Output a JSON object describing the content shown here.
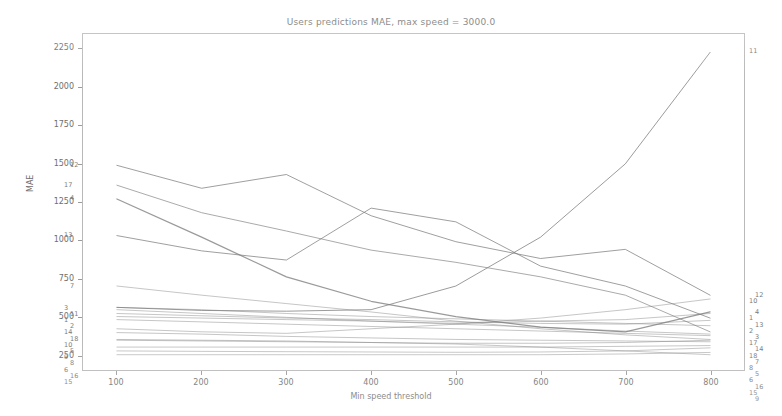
{
  "chart_data": {
    "type": "line",
    "title": "Users predictions MAE, max speed = 3000.0",
    "xlabel": "Min speed threshold",
    "ylabel": "MAE",
    "x": [
      100,
      200,
      300,
      400,
      500,
      600,
      700,
      800
    ],
    "xlim": [
      60,
      840
    ],
    "ylim": [
      150,
      2350
    ],
    "xticks": [
      100,
      200,
      300,
      400,
      500,
      600,
      700,
      800
    ],
    "yticks": [
      250,
      500,
      750,
      1000,
      1250,
      1500,
      1750,
      2000,
      2250
    ],
    "grid": false,
    "legend": "endpoint-annotations",
    "series": [
      {
        "name": "1",
        "label_left": "1",
        "label_right": "1",
        "values": [
          545,
          520,
          495,
          470,
          455,
          470,
          480,
          520
        ]
      },
      {
        "name": "2",
        "label_left": "2",
        "label_right": "2",
        "values": [
          520,
          505,
          490,
          480,
          465,
          455,
          450,
          475
        ]
      },
      {
        "name": "3",
        "label_left": "3",
        "label_right": "3",
        "values": [
          560,
          545,
          520,
          500,
          485,
          470,
          455,
          440
        ]
      },
      {
        "name": "4",
        "label_left": "4",
        "label_right": "4",
        "values": [
          1270,
          1020,
          760,
          600,
          500,
          430,
          400,
          530
        ]
      },
      {
        "name": "5",
        "label_left": "5",
        "label_right": "5",
        "values": [
          395,
          385,
          370,
          360,
          350,
          345,
          340,
          335
        ]
      },
      {
        "name": "6",
        "label_left": "6",
        "label_right": "6",
        "values": [
          300,
          300,
          300,
          300,
          300,
          300,
          305,
          310
        ]
      },
      {
        "name": "7",
        "label_left": "7",
        "label_right": "7",
        "values": [
          700,
          640,
          585,
          530,
          470,
          420,
          380,
          350
        ]
      },
      {
        "name": "8",
        "label_left": "8",
        "label_right": "8",
        "values": [
          345,
          340,
          335,
          330,
          325,
          325,
          330,
          345
        ]
      },
      {
        "name": "9",
        "label_left": "9",
        "label_right": "9",
        "values": [
          350,
          345,
          340,
          330,
          320,
          300,
          275,
          250
        ]
      },
      {
        "name": "10",
        "label_left": "10",
        "label_right": "10",
        "values": [
          420,
          400,
          390,
          420,
          450,
          490,
          545,
          615
        ]
      },
      {
        "name": "11",
        "label_left": "11",
        "label_right": "11",
        "values": [
          560,
          540,
          535,
          545,
          700,
          1020,
          1500,
          2230
        ]
      },
      {
        "name": "12",
        "label_left": "12",
        "label_right": "12",
        "values": [
          1490,
          1340,
          1430,
          1160,
          990,
          880,
          940,
          640
        ]
      },
      {
        "name": "13",
        "label_left": "13",
        "label_right": "13",
        "values": [
          1030,
          930,
          870,
          1210,
          1120,
          830,
          700,
          490
        ]
      },
      {
        "name": "14",
        "label_left": "14",
        "label_right": "14",
        "values": [
          500,
          490,
          480,
          470,
          450,
          430,
          405,
          385
        ]
      },
      {
        "name": "15",
        "label_left": "15",
        "label_right": "15",
        "values": [
          250,
          250,
          250,
          250,
          250,
          250,
          255,
          265
        ]
      },
      {
        "name": "16",
        "label_left": "16",
        "label_right": "16",
        "values": [
          275,
          272,
          270,
          268,
          266,
          268,
          275,
          295
        ]
      },
      {
        "name": "17",
        "label_left": "17",
        "label_right": "17",
        "values": [
          1360,
          1180,
          1060,
          935,
          855,
          760,
          640,
          400
        ]
      },
      {
        "name": "18",
        "label_left": "18",
        "label_right": "18",
        "values": [
          480,
          465,
          450,
          435,
          420,
          405,
          390,
          375
        ]
      }
    ]
  },
  "axes": {
    "ytick_labels": [
      "2250",
      "2000",
      "1750",
      "1500",
      "1250",
      "1000",
      "750",
      "500",
      "250"
    ],
    "xtick_labels": [
      "100",
      "200",
      "300",
      "400",
      "500",
      "600",
      "700",
      "800"
    ],
    "ylabel": "MAE",
    "xlabel": "Min speed threshold"
  },
  "title": "Users predictions MAE, max speed = 3000.0",
  "style": {
    "line_color": "#7d7d7d",
    "frame_color": "#b9b9b9",
    "text_color": "#6e6e6e",
    "background": "#ffffff"
  }
}
